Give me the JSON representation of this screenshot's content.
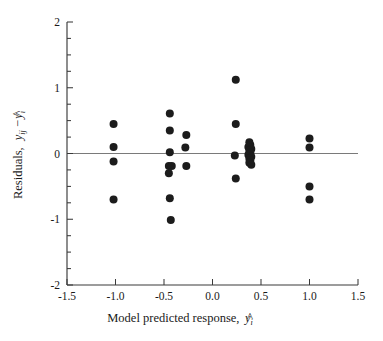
{
  "figure": {
    "type": "scatter-residual-plot",
    "background_color": "#ffffff",
    "point_color": "#1c1c1c",
    "axis_color": "#3a3a3a",
    "zero_line_color": "#7a7a7a"
  },
  "axes": {
    "x": {
      "label_parts": {
        "text": "Model predicted response,",
        "symbol_hat": "^",
        "symbol_var": "y",
        "symbol_sub": "i"
      },
      "label_full": "Model predicted response, ŷi",
      "min": -1.5,
      "max": 1.5,
      "ticks": [
        -1.5,
        -1.0,
        -0.5,
        0.0,
        0.5,
        1.0,
        1.5
      ],
      "tick_labels": [
        "-1.5",
        "-1.0",
        "-0.5",
        "0.0",
        "0.5",
        "1.0",
        "1.5"
      ]
    },
    "y": {
      "label_parts": {
        "text": "Residuals,",
        "symbol_var": "y",
        "symbol_sub": "ij",
        "minus": "−",
        "symbol_hat": "^",
        "symbol_var2": "y",
        "symbol_sub2": "i"
      },
      "label_full": "Residuals, yij − ŷi",
      "min": -2,
      "max": 2,
      "ticks": [
        -2,
        -1,
        0,
        1,
        2
      ],
      "tick_labels": [
        "-2",
        "-1",
        "0",
        "1",
        "2"
      ],
      "minor_ticks": [
        -1.75,
        -1.5,
        -1.25,
        -0.75,
        -0.5,
        -0.25,
        0.25,
        0.5,
        0.75,
        1.25,
        1.5,
        1.75
      ]
    }
  },
  "chart_data": {
    "type": "scatter",
    "title": "",
    "xlabel": "Model predicted response, ŷi",
    "ylabel": "Residuals, yij − ŷi",
    "xlim": [
      -1.5,
      1.5
    ],
    "ylim": [
      -2,
      2
    ],
    "grid": false,
    "legend": "none",
    "reference_line": {
      "orientation": "horizontal",
      "y": 0
    },
    "points": [
      {
        "x": -1.02,
        "y": 0.45
      },
      {
        "x": -1.02,
        "y": 0.1
      },
      {
        "x": -1.02,
        "y": -0.12
      },
      {
        "x": -1.02,
        "y": -0.7
      },
      {
        "x": -0.44,
        "y": 0.61
      },
      {
        "x": -0.44,
        "y": 0.35
      },
      {
        "x": -0.44,
        "y": 0.02
      },
      {
        "x": -0.45,
        "y": -0.19
      },
      {
        "x": -0.42,
        "y": -0.19
      },
      {
        "x": -0.45,
        "y": -0.3
      },
      {
        "x": -0.44,
        "y": -0.68
      },
      {
        "x": -0.43,
        "y": -1.01
      },
      {
        "x": -0.27,
        "y": 0.28
      },
      {
        "x": -0.28,
        "y": 0.09
      },
      {
        "x": -0.27,
        "y": -0.19
      },
      {
        "x": 0.24,
        "y": 1.12
      },
      {
        "x": 0.24,
        "y": 0.45
      },
      {
        "x": 0.23,
        "y": -0.03
      },
      {
        "x": 0.24,
        "y": -0.38
      },
      {
        "x": 0.38,
        "y": 0.17
      },
      {
        "x": 0.39,
        "y": 0.13
      },
      {
        "x": 0.37,
        "y": 0.1
      },
      {
        "x": 0.4,
        "y": 0.07
      },
      {
        "x": 0.38,
        "y": 0.04
      },
      {
        "x": 0.39,
        "y": 0.01
      },
      {
        "x": 0.37,
        "y": -0.02
      },
      {
        "x": 0.4,
        "y": -0.05
      },
      {
        "x": 0.38,
        "y": -0.08
      },
      {
        "x": 0.39,
        "y": -0.11
      },
      {
        "x": 0.38,
        "y": -0.14
      },
      {
        "x": 0.4,
        "y": -0.17
      },
      {
        "x": 1.0,
        "y": 0.23
      },
      {
        "x": 1.0,
        "y": 0.09
      },
      {
        "x": 1.0,
        "y": -0.5
      },
      {
        "x": 1.0,
        "y": -0.7
      }
    ]
  }
}
